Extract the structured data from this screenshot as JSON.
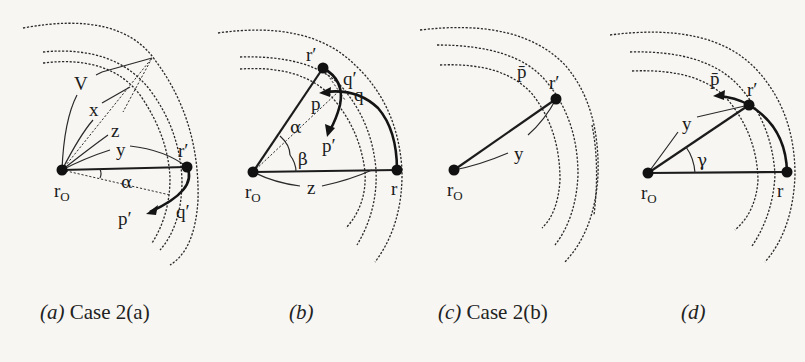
{
  "figure": {
    "panels": [
      {
        "id": "a",
        "caption_prefix": "(a)",
        "caption_text": "Case 2(a)",
        "nodes": {
          "origin": "r",
          "origin_sub": "O",
          "moved": "r′"
        },
        "labels": {
          "V": "V",
          "x": "x",
          "z": "z",
          "y": "y",
          "alpha": "α",
          "p_prime": "p′",
          "q_prime": "q′"
        }
      },
      {
        "id": "b",
        "caption_prefix": "(b)",
        "caption_text": "",
        "nodes": {
          "origin": "r",
          "origin_sub": "O",
          "moved": "r′",
          "target": "r"
        },
        "labels": {
          "p": "p",
          "q_prime": "q′",
          "q": "q",
          "p_prime": "p′",
          "alpha": "α",
          "beta": "β",
          "z": "z"
        }
      },
      {
        "id": "c",
        "caption_prefix": "(c)",
        "caption_text": "Case 2(b)",
        "nodes": {
          "origin": "r",
          "origin_sub": "O",
          "moved": "r′"
        },
        "labels": {
          "p_bar": "p̄",
          "y": "y"
        }
      },
      {
        "id": "d",
        "caption_prefix": "(d)",
        "caption_text": "",
        "nodes": {
          "origin": "r",
          "origin_sub": "O",
          "moved": "r′",
          "target": "r"
        },
        "labels": {
          "p_bar": "p̄",
          "y": "y",
          "gamma": "γ"
        }
      }
    ]
  },
  "colors": {
    "ink": "#1c1c1c",
    "paper": "#f7f6f3"
  }
}
